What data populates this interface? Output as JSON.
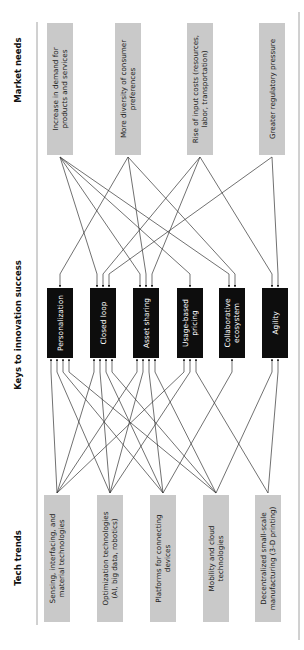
{
  "diagram": {
    "title_fragment": "o",
    "columns": {
      "market_needs": "Market needs",
      "keys": "Keys to innovation success",
      "tech_trends": "Tech trends"
    },
    "colors": {
      "gray_box": "#c9c9c9",
      "key_box": "#0d0d0d",
      "line": "#333333",
      "rule": "#888888"
    },
    "market_needs": [
      {
        "lines": [
          "Increase in demand for",
          "products and services"
        ]
      },
      {
        "lines": [
          "More diversity of consumer",
          "preferences"
        ]
      },
      {
        "lines": [
          "Rise of input costs (resources,",
          "labor, transportation)"
        ]
      },
      {
        "lines": [
          "Greater regulatory pressure"
        ]
      }
    ],
    "keys": [
      {
        "lines": [
          "Personalization"
        ]
      },
      {
        "lines": [
          "Closed loop"
        ]
      },
      {
        "lines": [
          "Asset sharing"
        ]
      },
      {
        "lines": [
          "Usage-based",
          "pricing"
        ]
      },
      {
        "lines": [
          "Collaborative",
          "ecosystem"
        ]
      },
      {
        "lines": [
          "Agility"
        ]
      }
    ],
    "tech_trends": [
      {
        "lines": [
          "Sensing, interfacing, and",
          "material technologies"
        ]
      },
      {
        "lines": [
          "Optimization technologies",
          "(AI, big data, robotics)"
        ]
      },
      {
        "lines": [
          "Platforms for connecting",
          "devices"
        ]
      },
      {
        "lines": [
          "Mobility and cloud",
          "technologies"
        ]
      },
      {
        "lines": [
          "Decentralized small-scale",
          "manufacturing (3-D printing)"
        ]
      }
    ],
    "market_to_key_links": [
      [
        0,
        1
      ],
      [
        0,
        2
      ],
      [
        0,
        3
      ],
      [
        0,
        4
      ],
      [
        1,
        0
      ],
      [
        1,
        2
      ],
      [
        1,
        4
      ],
      [
        2,
        1
      ],
      [
        2,
        2
      ],
      [
        2,
        5
      ],
      [
        3,
        1
      ],
      [
        3,
        5
      ]
    ],
    "tech_to_key_links": [
      [
        0,
        0
      ],
      [
        0,
        1
      ],
      [
        0,
        2
      ],
      [
        0,
        3
      ],
      [
        1,
        0
      ],
      [
        1,
        1
      ],
      [
        1,
        2
      ],
      [
        1,
        3
      ],
      [
        2,
        0
      ],
      [
        2,
        1
      ],
      [
        2,
        2
      ],
      [
        2,
        4
      ],
      [
        3,
        0
      ],
      [
        3,
        1
      ],
      [
        3,
        2
      ],
      [
        3,
        5
      ],
      [
        4,
        3
      ],
      [
        4,
        5
      ]
    ]
  }
}
